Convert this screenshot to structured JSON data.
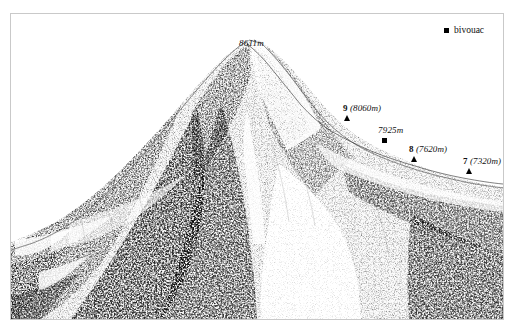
{
  "figure": {
    "type": "mountain-profile-illustration",
    "background_color": "#ffffff",
    "ink_color": "#101010",
    "frame_color": "#c9c9c9"
  },
  "legend": {
    "marker_icon": "filled-square-marker",
    "label": "bivouac"
  },
  "summit": {
    "label": "8611m"
  },
  "annotations": [
    {
      "id": "camp-9",
      "camp_number": "9",
      "elevation": "(8060m)",
      "full_label": "9 (8060m)",
      "marker": "triangle",
      "marker_icon": "filled-triangle-marker"
    },
    {
      "id": "bivouac-7925",
      "camp_number": "",
      "elevation": "7925m",
      "full_label": "7925m",
      "marker": "square",
      "marker_icon": "filled-square-marker"
    },
    {
      "id": "camp-8",
      "camp_number": "8",
      "elevation": "(7620m)",
      "full_label": "8 (7620m)",
      "marker": "triangle",
      "marker_icon": "filled-triangle-marker"
    },
    {
      "id": "camp-7",
      "camp_number": "7",
      "elevation": "(7320m)",
      "full_label": "7 (7320m)",
      "marker": "triangle",
      "marker_icon": "filled-triangle-marker"
    }
  ]
}
